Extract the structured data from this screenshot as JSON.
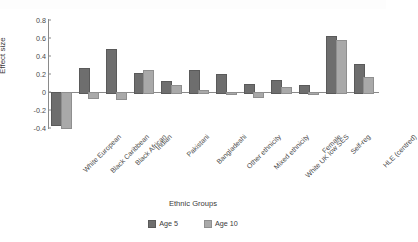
{
  "chart_data": {
    "type": "bar",
    "title": "",
    "xlabel": "Ethnic Groups",
    "ylabel": "Effect size",
    "ylim": [
      -0.4,
      0.8
    ],
    "yticks": [
      0.8,
      0.6,
      0.4,
      0.2,
      0,
      -0.2,
      -0.4
    ],
    "ytick_labels": [
      "0.8",
      "0.6",
      "0.4",
      "0.2",
      "0",
      "-0.2",
      "-0.4"
    ],
    "grid": false,
    "legend_position": "bottom",
    "categories": [
      "White European",
      "Black Caribbean",
      "Black African",
      "Indian",
      "Pakistani",
      "Bangladeshi",
      "Other ethnicity",
      "Mixed ethnicity",
      "White UK low SES",
      "Female",
      "Self-reg",
      "HLE (centred)"
    ],
    "series": [
      {
        "name": "Age 5",
        "color": "#6e6e6e",
        "values": [
          -0.36,
          0.27,
          0.48,
          0.21,
          0.12,
          0.24,
          0.2,
          0.09,
          0.13,
          0.08,
          0.62,
          0.31
        ]
      },
      {
        "name": "Age 10",
        "color": "#a9a9a9",
        "values": [
          -0.39,
          -0.06,
          -0.07,
          0.24,
          0.08,
          0.02,
          -0.01,
          -0.04,
          0.06,
          -0.01,
          0.58,
          0.17
        ]
      }
    ]
  },
  "legend": {
    "items": [
      {
        "label": "Age 5",
        "series": 0
      },
      {
        "label": "Age 10",
        "series": 1
      }
    ]
  }
}
